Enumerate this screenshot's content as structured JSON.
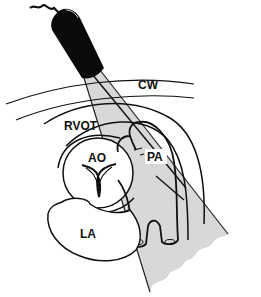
{
  "diagram": {
    "type": "echocardiography-probe-view",
    "labels": {
      "cw": "CW",
      "rvot": "RVOT",
      "ao": "AO",
      "pa": "PA",
      "la": "LA"
    },
    "colors": {
      "ink": "#111111",
      "beam_fill": "#d8d8d8",
      "probe": "#0a0a0a",
      "background": "#ffffff"
    }
  }
}
